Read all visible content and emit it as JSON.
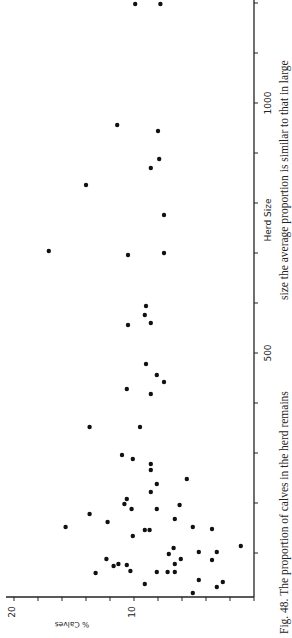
{
  "figure": {
    "caption": "Fig. 48. The proportion of calves in the herd remains",
    "caption_continued": "size the average proportion is similar to that in large",
    "orientation": "rotated 90 degrees counterclockwise"
  },
  "chart_data": {
    "type": "scatter",
    "title": "",
    "xlabel": "Herd Size",
    "ylabel": "% Calves",
    "xlim": [
      0,
      1200
    ],
    "ylim": [
      0,
      20
    ],
    "x_ticks": [
      0,
      100,
      200,
      300,
      400,
      500,
      600,
      700,
      800,
      900,
      1000,
      1100,
      1200
    ],
    "x_tick_labels": [
      {
        "value": 500,
        "label": "500"
      },
      {
        "value": 1000,
        "label": "1000"
      }
    ],
    "y_ticks": [
      0,
      2,
      4,
      6,
      8,
      10,
      12,
      14,
      16,
      18,
      20
    ],
    "y_tick_labels": [
      {
        "value": 10,
        "label": "10"
      },
      {
        "value": 20,
        "label": "20"
      }
    ],
    "grid": false,
    "legend": null,
    "marker_color": "#111111",
    "points": [
      {
        "x": 1198,
        "y": 9.9
      },
      {
        "x": 1198,
        "y": 7.8
      },
      {
        "x": 956,
        "y": 11.4
      },
      {
        "x": 944,
        "y": 8.0
      },
      {
        "x": 888,
        "y": 7.9
      },
      {
        "x": 870,
        "y": 8.6
      },
      {
        "x": 836,
        "y": 14.0
      },
      {
        "x": 776,
        "y": 7.5
      },
      {
        "x": 704,
        "y": 17.1
      },
      {
        "x": 700,
        "y": 7.5
      },
      {
        "x": 696,
        "y": 10.5
      },
      {
        "x": 594,
        "y": 9.0
      },
      {
        "x": 576,
        "y": 9.1
      },
      {
        "x": 560,
        "y": 8.6
      },
      {
        "x": 556,
        "y": 10.5
      },
      {
        "x": 478,
        "y": 9.0
      },
      {
        "x": 456,
        "y": 8.1
      },
      {
        "x": 442,
        "y": 7.5
      },
      {
        "x": 428,
        "y": 10.6
      },
      {
        "x": 418,
        "y": 8.6
      },
      {
        "x": 352,
        "y": 13.7
      },
      {
        "x": 352,
        "y": 9.5
      },
      {
        "x": 296,
        "y": 11.0
      },
      {
        "x": 288,
        "y": 10.1
      },
      {
        "x": 278,
        "y": 8.6
      },
      {
        "x": 266,
        "y": 8.6
      },
      {
        "x": 248,
        "y": 5.6
      },
      {
        "x": 238,
        "y": 8.1
      },
      {
        "x": 222,
        "y": 8.6
      },
      {
        "x": 208,
        "y": 10.6
      },
      {
        "x": 198,
        "y": 10.8
      },
      {
        "x": 196,
        "y": 6.2
      },
      {
        "x": 188,
        "y": 10.2
      },
      {
        "x": 188,
        "y": 8.1
      },
      {
        "x": 178,
        "y": 13.7
      },
      {
        "x": 168,
        "y": 6.6
      },
      {
        "x": 162,
        "y": 12.2
      },
      {
        "x": 152,
        "y": 15.7
      },
      {
        "x": 152,
        "y": 5.1
      },
      {
        "x": 148,
        "y": 3.5
      },
      {
        "x": 146,
        "y": 9.1
      },
      {
        "x": 146,
        "y": 8.7
      },
      {
        "x": 134,
        "y": 10.1
      },
      {
        "x": 114,
        "y": 1.1
      },
      {
        "x": 110,
        "y": 6.7
      },
      {
        "x": 102,
        "y": 4.6
      },
      {
        "x": 102,
        "y": 3.1
      },
      {
        "x": 98,
        "y": 7.1
      },
      {
        "x": 88,
        "y": 12.3
      },
      {
        "x": 88,
        "y": 6.1
      },
      {
        "x": 86,
        "y": 3.5
      },
      {
        "x": 78,
        "y": 11.3
      },
      {
        "x": 78,
        "y": 6.6
      },
      {
        "x": 76,
        "y": 10.6
      },
      {
        "x": 74,
        "y": 11.7
      },
      {
        "x": 64,
        "y": 10.3
      },
      {
        "x": 62,
        "y": 8.1
      },
      {
        "x": 62,
        "y": 7.2
      },
      {
        "x": 62,
        "y": 6.6
      },
      {
        "x": 60,
        "y": 13.2
      },
      {
        "x": 46,
        "y": 4.6
      },
      {
        "x": 42,
        "y": 2.6
      },
      {
        "x": 38,
        "y": 9.1
      },
      {
        "x": 32,
        "y": 3.1
      },
      {
        "x": 20,
        "y": 5.1
      }
    ]
  }
}
